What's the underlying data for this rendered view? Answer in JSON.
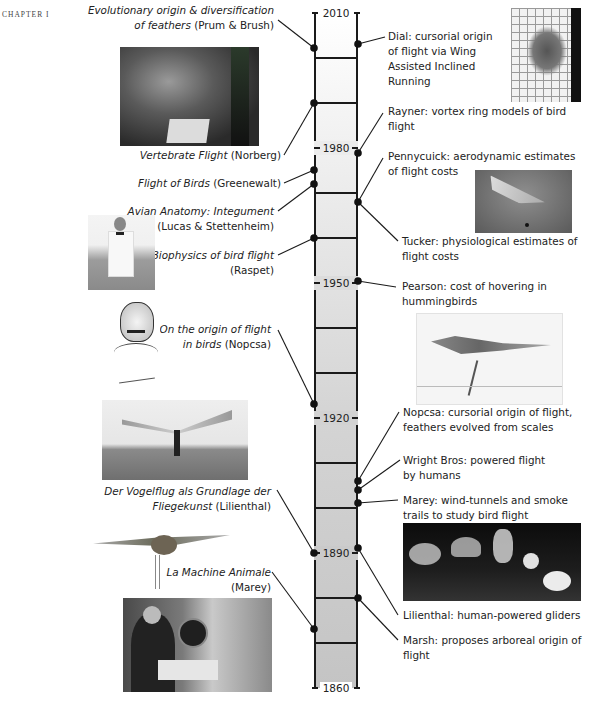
{
  "page": {
    "chapter_label": "CHAPTER I"
  },
  "timeline": {
    "start_year": 2010,
    "end_year": 1860,
    "year_labels": [
      "2010",
      "1980",
      "1950",
      "1920",
      "1890",
      "1860"
    ],
    "colors": {
      "bar_top": "#ffffff",
      "bar_bottom": "#c4c4c4",
      "line": "#1a1a1a"
    }
  },
  "left_events": [
    {
      "title": "Evolutionary origin & diversification",
      "title2": "of feathers",
      "author": "(Prum & Brush)"
    },
    {
      "title": "Vertebrate Flight",
      "author": "(Norberg)"
    },
    {
      "title": "Flight of Birds",
      "author": "(Greenewalt)"
    },
    {
      "title": "Avian Anatomy: Integument",
      "author": "(Lucas & Stettenheim)"
    },
    {
      "title": "Biophysics of bird flight",
      "author": "(Raspet)"
    },
    {
      "title": "On the origin of flight",
      "title2": "in birds",
      "author": "(Nopcsa)"
    },
    {
      "title": "Der Vogelflug als Grundlage der",
      "title2": "Fliegekunst",
      "author": "(Lilienthal)"
    },
    {
      "title": "La Machine  Animale",
      "author": "(Marey)"
    }
  ],
  "right_events": [
    {
      "line1": "Dial: cursorial origin",
      "line2": "of flight via Wing",
      "line3": "Assisted Inclined",
      "line4": "Running"
    },
    {
      "line1": "Rayner: vortex ring models of bird",
      "line2": "flight"
    },
    {
      "line1": "Pennycuick: aerodynamic estimates",
      "line2": "of flight costs"
    },
    {
      "line1": "Tucker: physiological estimates of",
      "line2": "flight costs"
    },
    {
      "line1": "Pearson: cost of hovering in",
      "line2": "hummingbirds"
    },
    {
      "line1": "Nopcsa: cursorial origin of flight,",
      "line2": "feathers evolved from scales"
    },
    {
      "line1": "Wright Bros: powered flight",
      "line2": "by humans"
    },
    {
      "line1": "Marey: wind-tunnels and smoke",
      "line2": "trails to study bird flight"
    },
    {
      "line1": "Lilienthal: human-powered gliders"
    },
    {
      "line1": "Marsh: proposes arboreal origin of",
      "line2": "flight"
    }
  ],
  "photos": [
    {
      "name": "norberg-photo",
      "subject": "man at desk with bird wing drawings"
    },
    {
      "name": "raspet-photo",
      "subject": "man in bow tie with bird"
    },
    {
      "name": "nopcsa-portrait",
      "subject": "sketched portrait with signature"
    },
    {
      "name": "lilienthal-glider-photo",
      "subject": "man with glider on hill"
    },
    {
      "name": "bird-model-photo",
      "subject": "mechanical bird model"
    },
    {
      "name": "marey-photo",
      "subject": "man at desk with instruments"
    },
    {
      "name": "dial-photo",
      "subject": "bird running up grid"
    },
    {
      "name": "pennycuick-photo",
      "subject": "bird in wind tunnel"
    },
    {
      "name": "nopcsa-dinosaur-drawing",
      "subject": "running feathered dinosaur sketch"
    },
    {
      "name": "marey-smoke-photo",
      "subject": "smoke trails wind tunnel"
    }
  ]
}
